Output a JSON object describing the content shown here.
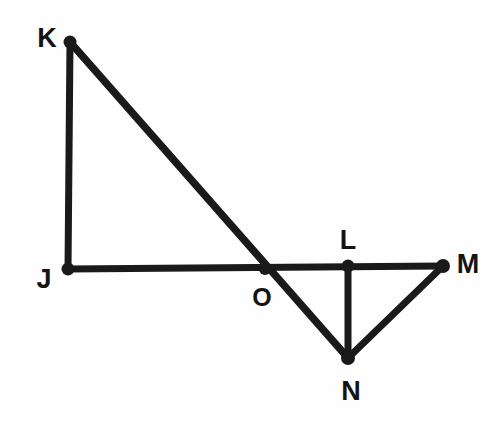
{
  "figure": {
    "background_color": "#fefefe",
    "ink_color": "#1a1a1a",
    "width": 500,
    "height": 425,
    "stroke_width": 7,
    "vertex_dot_radius": 6
  },
  "points": [
    {
      "id": "K",
      "label": "K",
      "x": 70,
      "y": 42,
      "label_x": 47,
      "label_y": 38
    },
    {
      "id": "J",
      "label": "J",
      "x": 68,
      "y": 269,
      "label_x": 44,
      "label_y": 279
    },
    {
      "id": "O",
      "label": "O",
      "x": 265,
      "y": 269,
      "label_x": 262,
      "label_y": 297
    },
    {
      "id": "L",
      "label": "L",
      "x": 348,
      "y": 266,
      "label_x": 348,
      "label_y": 240
    },
    {
      "id": "M",
      "label": "M",
      "x": 443,
      "y": 266,
      "label_x": 468,
      "label_y": 264
    },
    {
      "id": "N",
      "label": "N",
      "x": 348,
      "y": 358,
      "label_x": 351,
      "label_y": 391
    }
  ],
  "segments": [
    {
      "id": "KJ",
      "from": "K",
      "to": "J",
      "x1": 70,
      "y1": 42,
      "x2": 68,
      "y2": 269
    },
    {
      "id": "JM",
      "from": "J",
      "to": "M",
      "x1": 68,
      "y1": 269,
      "x2": 443,
      "y2": 266
    },
    {
      "id": "KN",
      "from": "K",
      "to": "N",
      "x1": 70,
      "y1": 42,
      "x2": 348,
      "y2": 358
    },
    {
      "id": "LN",
      "from": "L",
      "to": "N",
      "x1": 348,
      "y1": 266,
      "x2": 348,
      "y2": 358
    },
    {
      "id": "NM",
      "from": "N",
      "to": "M",
      "x1": 348,
      "y1": 358,
      "x2": 443,
      "y2": 266
    }
  ]
}
